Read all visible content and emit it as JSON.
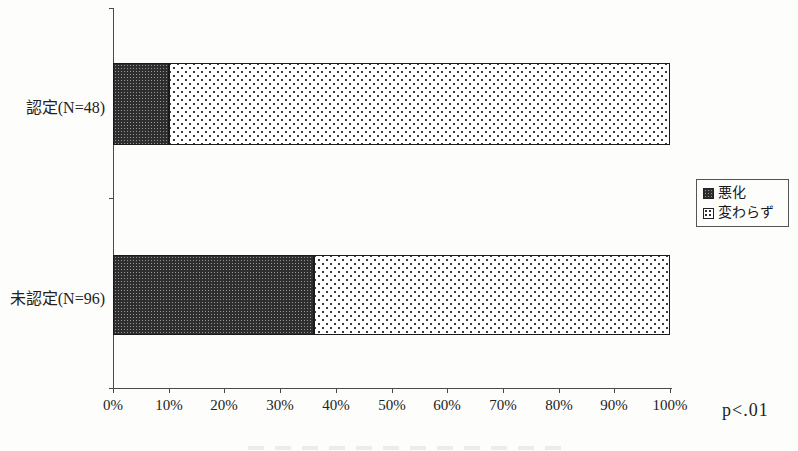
{
  "figure": {
    "background": "#fdfdfc"
  },
  "chart_data": {
    "type": "bar",
    "orientation": "horizontal",
    "stacked": true,
    "percent_stacked": true,
    "title": "",
    "xlabel": "",
    "ylabel": "",
    "categories": [
      "認定(N=48)",
      "未認定(N=96)"
    ],
    "series": [
      {
        "name": "悪化",
        "values": [
          10,
          36
        ],
        "pattern": "dark-dense-dots"
      },
      {
        "name": "変わらず",
        "values": [
          90,
          64
        ],
        "pattern": "light-sparse-dots"
      }
    ],
    "x_ticks": [
      "0%",
      "10%",
      "20%",
      "30%",
      "40%",
      "50%",
      "60%",
      "70%",
      "80%",
      "90%",
      "100%"
    ],
    "xlim": [
      0,
      100
    ],
    "grid": false,
    "legend_position": "right",
    "annotation": "p<.01",
    "colors": {
      "dark_fill": "#2e2e2e",
      "light_fill_dot": "#3a3a3a",
      "segment_border": "#1a1a1a",
      "axis": "#4a4a4a",
      "background": "#fdfdfc"
    }
  }
}
